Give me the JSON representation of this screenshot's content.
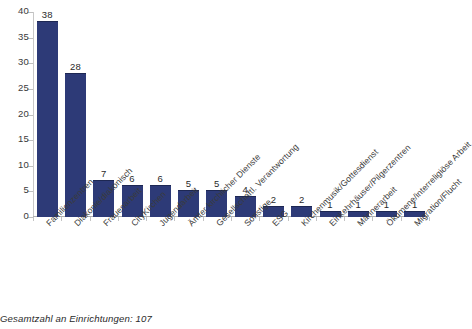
{
  "chart_data": {
    "type": "bar",
    "title": "",
    "xlabel": "",
    "ylabel": "",
    "ylim": [
      0,
      40
    ],
    "yticks": [
      0,
      5,
      10,
      15,
      20,
      25,
      30,
      35,
      40
    ],
    "grid": false,
    "legend": null,
    "bar_color": "#2d3a77",
    "categories": [
      "Familienzentren",
      "Diakonie/diakonisch",
      "Frauenarbeit",
      "CityKirchen",
      "Jugendarbeit",
      "Ämter kirchlicher Dienste",
      "Gesellschaftl. Verantwortung",
      "Sonstige",
      "ESG",
      "Kirchenmusik/Gottesdienst",
      "Einkehrhäuser/Pilgerzentren",
      "Männerarbeit",
      "Ökumene/interreligiöse Arbeit",
      "Migration/Flucht"
    ],
    "values": [
      38,
      28,
      7,
      6,
      6,
      5,
      5,
      4,
      2,
      2,
      1,
      1,
      1,
      1
    ],
    "annotations": {
      "footnote": "Gesamtzahl an Einrichtungen: 107"
    }
  }
}
